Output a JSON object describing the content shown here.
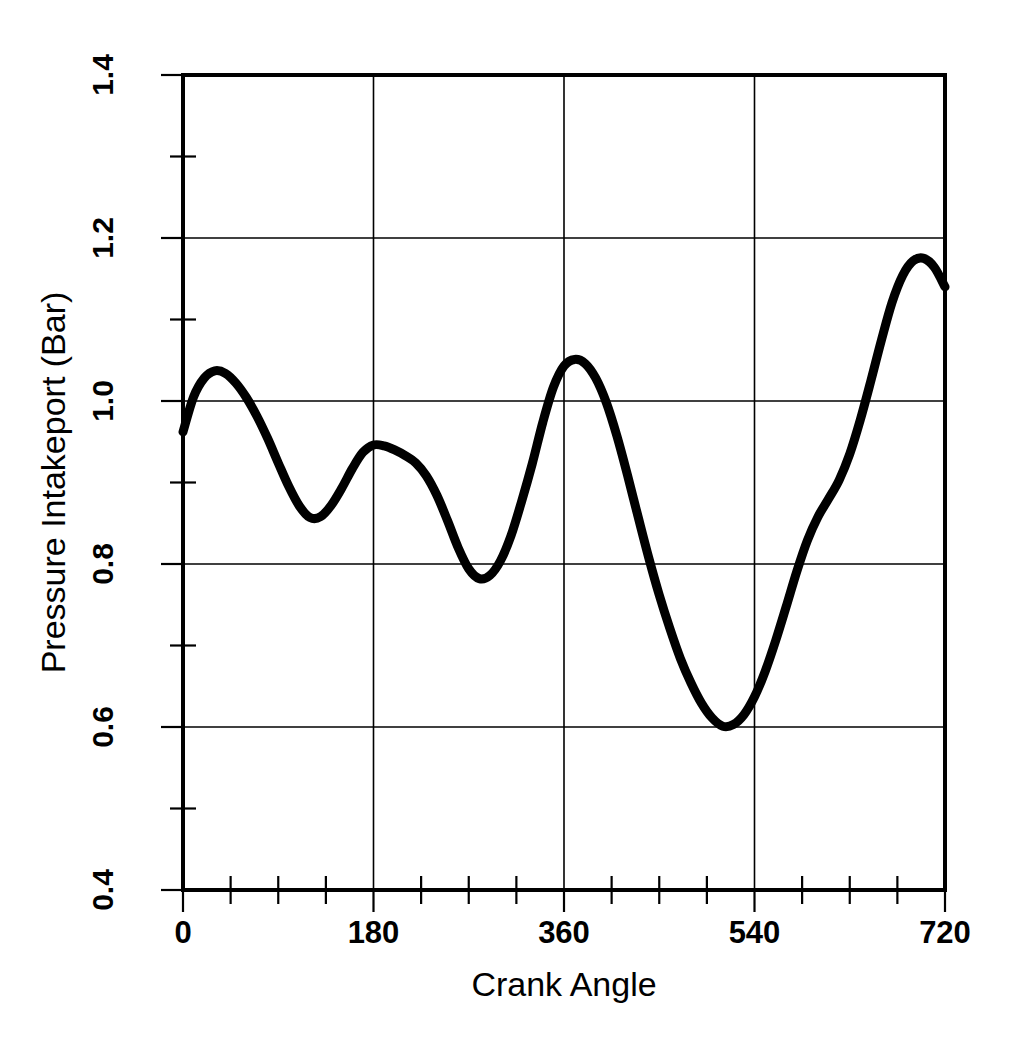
{
  "chart_data": {
    "type": "line",
    "title": "",
    "xlabel": "Crank Angle",
    "ylabel": "Pressure Intakeport (Bar)",
    "xlim": [
      0,
      720
    ],
    "ylim": [
      0.4,
      1.4
    ],
    "grid": true,
    "legend": null,
    "xticks": [
      0,
      180,
      360,
      540,
      720
    ],
    "xtick_labels": [
      "0",
      "180",
      "360",
      "540",
      "720"
    ],
    "x_minor_tick_interval": 45,
    "yticks": [
      0.4,
      0.6,
      0.8,
      1.0,
      1.2,
      1.4
    ],
    "ytick_labels": [
      "0.4",
      "0.6",
      "0.8",
      "1.0",
      "1.2",
      "1.4"
    ],
    "y_minor_tick_interval": 0.1,
    "line_color": "#000000",
    "line_width_px": 9,
    "series": [
      {
        "name": "Pressure Intakeport",
        "x": [
          0,
          10,
          20,
          30,
          40,
          50,
          60,
          70,
          80,
          90,
          100,
          110,
          120,
          130,
          140,
          150,
          160,
          170,
          180,
          190,
          200,
          210,
          220,
          230,
          240,
          250,
          260,
          270,
          280,
          290,
          300,
          310,
          320,
          330,
          340,
          350,
          360,
          370,
          380,
          390,
          400,
          410,
          420,
          430,
          440,
          450,
          460,
          470,
          480,
          490,
          500,
          510,
          520,
          530,
          540,
          550,
          560,
          570,
          580,
          590,
          600,
          610,
          620,
          630,
          640,
          650,
          660,
          670,
          680,
          690,
          700,
          710,
          720
        ],
        "y": [
          0.962,
          1.005,
          1.028,
          1.037,
          1.034,
          1.022,
          1.004,
          0.981,
          0.954,
          0.924,
          0.895,
          0.871,
          0.857,
          0.858,
          0.872,
          0.893,
          0.917,
          0.937,
          0.946,
          0.945,
          0.94,
          0.933,
          0.924,
          0.908,
          0.884,
          0.853,
          0.82,
          0.794,
          0.782,
          0.786,
          0.804,
          0.835,
          0.877,
          0.923,
          0.974,
          1.017,
          1.043,
          1.051,
          1.046,
          1.028,
          0.998,
          0.957,
          0.909,
          0.858,
          0.808,
          0.762,
          0.721,
          0.684,
          0.654,
          0.629,
          0.611,
          0.601,
          0.603,
          0.615,
          0.637,
          0.668,
          0.706,
          0.748,
          0.791,
          0.829,
          0.858,
          0.88,
          0.903,
          0.935,
          0.977,
          1.025,
          1.075,
          1.121,
          1.154,
          1.172,
          1.175,
          1.164,
          1.14
        ],
        "note": "primary trace continues past 720 index; see segment_points for the full drawn path"
      }
    ],
    "key_points": [
      {
        "label": "start",
        "x": 0,
        "y": 0.96
      },
      {
        "label": "peak-1",
        "x": 30,
        "y": 1.04
      },
      {
        "label": "trough-1",
        "x": 125,
        "y": 0.855
      },
      {
        "label": "peak-2",
        "x": 190,
        "y": 0.945
      },
      {
        "label": "trough-2",
        "x": 290,
        "y": 0.785
      },
      {
        "label": "peak-3",
        "x": 375,
        "y": 1.05
      },
      {
        "label": "trough-3",
        "x": 510,
        "y": 0.6
      },
      {
        "label": "peak-4",
        "x": 570,
        "y": 1.175
      },
      {
        "label": "trough-4",
        "x": 665,
        "y": 0.748
      },
      {
        "label": "end",
        "x": 720,
        "y": 0.935
      }
    ]
  },
  "axes": {
    "x_title": "Crank Angle",
    "y_title": "Pressure Intakeport (Bar)"
  }
}
